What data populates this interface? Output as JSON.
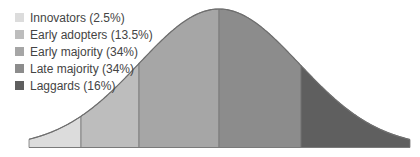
{
  "chart_data": {
    "type": "area",
    "title": "",
    "xlabel": "",
    "ylabel": "",
    "grid": false,
    "legend_position": "top-left",
    "categories": [
      "Innovators",
      "Early adopters",
      "Early majority",
      "Late majority",
      "Laggards"
    ],
    "values": [
      2.5,
      13.5,
      34,
      34,
      16
    ],
    "unit": "%",
    "legend": [
      {
        "label": "Innovators (2.5%)",
        "color": "#dcdcdc"
      },
      {
        "label": "Early adopters (13.5%)",
        "color": "#bdbdbd"
      },
      {
        "label": "Early majority (34%)",
        "color": "#a6a6a6"
      },
      {
        "label": "Late majority (34%)",
        "color": "#8c8c8c"
      },
      {
        "label": "Laggards (16%)",
        "color": "#5f5f5f"
      }
    ],
    "segment_boundaries_px": [
      29,
      81,
      139,
      219,
      301,
      410
    ]
  }
}
